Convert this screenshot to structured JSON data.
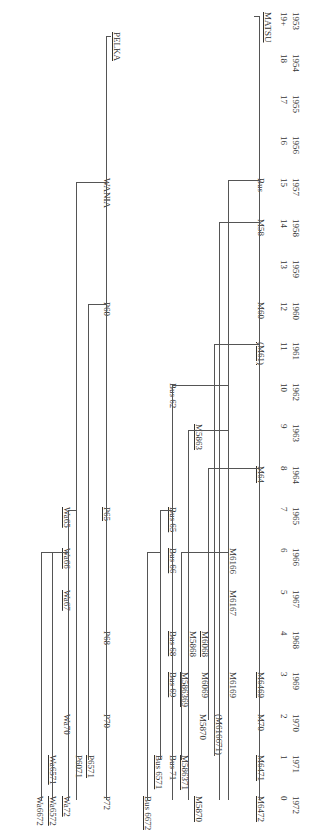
{
  "timeline": {
    "years": [
      "1953",
      "1954",
      "1955",
      "1956",
      "1957",
      "1958",
      "1959",
      "1960",
      "1961",
      "1962",
      "1963",
      "1964",
      "1965",
      "1966",
      "1967",
      "1968",
      "1969",
      "1970",
      "1971",
      "1972"
    ],
    "counts": [
      "19+",
      "18",
      "17",
      "16",
      "15",
      "14",
      "13",
      "12",
      "11",
      "10",
      "9",
      "8",
      "7",
      "6",
      "5",
      "4",
      "3",
      "2",
      "1",
      "0"
    ],
    "year_y": [
      12,
      54,
      95,
      136,
      178,
      219,
      260,
      302,
      342,
      383,
      424,
      466,
      507,
      548,
      590,
      631,
      672,
      714,
      755,
      796
    ]
  },
  "roots": [
    {
      "id": "MATSU",
      "label": "MATSU",
      "x": 262,
      "y": 12,
      "underline": true
    },
    {
      "id": "PELKA",
      "label": "PELKA",
      "x": 111,
      "y": 32,
      "underline": true
    }
  ],
  "nodes": [
    {
      "label": "Bus",
      "x": 256,
      "y": 178,
      "underline": false
    },
    {
      "label": "M58",
      "x": 256,
      "y": 219,
      "underline": false
    },
    {
      "label": "M60",
      "x": 256,
      "y": 302,
      "underline": false
    },
    {
      "label": "(M61)",
      "x": 256,
      "y": 342,
      "underline": true
    },
    {
      "label": "M64",
      "x": 256,
      "y": 466,
      "underline": true
    },
    {
      "label": "M6469",
      "x": 256,
      "y": 672,
      "underline": true
    },
    {
      "label": "M70",
      "x": 256,
      "y": 714,
      "underline": false
    },
    {
      "label": "M6471",
      "x": 256,
      "y": 755,
      "underline": true
    },
    {
      "label": "M6472",
      "x": 256,
      "y": 796,
      "underline": true
    },
    {
      "label": "M6166",
      "x": 228,
      "y": 548,
      "underline": true
    },
    {
      "label": "M6167",
      "x": 228,
      "y": 590,
      "underline": true
    },
    {
      "label": "M6169",
      "x": 228,
      "y": 672,
      "underline": false
    },
    {
      "label": "(M616671)",
      "x": 214,
      "y": 714,
      "underline": true
    },
    {
      "label": "M5863",
      "x": 194,
      "y": 424,
      "underline": true
    },
    {
      "label": "M6068",
      "x": 200,
      "y": 631,
      "underline": true
    },
    {
      "label": "M6069",
      "x": 200,
      "y": 672,
      "underline": false
    },
    {
      "label": "M5868",
      "x": 188,
      "y": 631,
      "underline": true
    },
    {
      "label": "M5870",
      "x": 198,
      "y": 714,
      "underline": false
    },
    {
      "label": "M586369",
      "x": 180,
      "y": 672,
      "underline": true
    },
    {
      "label": "M586371",
      "x": 180,
      "y": 755,
      "underline": true
    },
    {
      "label": "M5870",
      "x": 194,
      "y": 796,
      "underline": true
    },
    {
      "label": "Bus 62",
      "x": 168,
      "y": 383,
      "underline": false
    },
    {
      "label": "Bus 65",
      "x": 168,
      "y": 507,
      "underline": true
    },
    {
      "label": "Bus 66",
      "x": 168,
      "y": 548,
      "underline": true
    },
    {
      "label": "Bus 68",
      "x": 168,
      "y": 631,
      "underline": true
    },
    {
      "label": "Bus 69",
      "x": 168,
      "y": 672,
      "underline": true
    },
    {
      "label": "Bus 71",
      "x": 168,
      "y": 755,
      "underline": false
    },
    {
      "label": "Bus 6571",
      "x": 154,
      "y": 755,
      "underline": true
    },
    {
      "label": "Bus 6672",
      "x": 143,
      "y": 796,
      "underline": true
    },
    {
      "label": "WANIA",
      "x": 102,
      "y": 178,
      "underline": false
    },
    {
      "label": "P60",
      "x": 102,
      "y": 302,
      "underline": false
    },
    {
      "label": "P65",
      "x": 102,
      "y": 507,
      "underline": true
    },
    {
      "label": "P68",
      "x": 102,
      "y": 631,
      "underline": false
    },
    {
      "label": "P70",
      "x": 102,
      "y": 714,
      "underline": false
    },
    {
      "label": "P72",
      "x": 102,
      "y": 796,
      "underline": false
    },
    {
      "label": "P6571",
      "x": 86,
      "y": 755,
      "underline": true
    },
    {
      "label": "P6071",
      "x": 74,
      "y": 755,
      "underline": false
    },
    {
      "label": "Wa65",
      "x": 62,
      "y": 507,
      "underline": true
    },
    {
      "label": "Wa66",
      "x": 62,
      "y": 548,
      "underline": true
    },
    {
      "label": "Wa67",
      "x": 62,
      "y": 590,
      "underline": true
    },
    {
      "label": "Wa70",
      "x": 62,
      "y": 714,
      "underline": false
    },
    {
      "label": "Wa72",
      "x": 62,
      "y": 796,
      "underline": true
    },
    {
      "label": "Wa6571",
      "x": 48,
      "y": 755,
      "underline": true
    },
    {
      "label": "Wa6572",
      "x": 48,
      "y": 796,
      "underline": true
    },
    {
      "label": "Wa6672",
      "x": 35,
      "y": 796,
      "underline": false
    }
  ],
  "vlines": [
    [
      259,
      16,
      800
    ],
    [
      228,
      180,
      800
    ],
    [
      219,
      222,
      800
    ],
    [
      214,
      344,
      756
    ],
    [
      208,
      468,
      720
    ],
    [
      188,
      430,
      800
    ],
    [
      181,
      552,
      760
    ],
    [
      172,
      385,
      800
    ],
    [
      160,
      510,
      760
    ],
    [
      147,
      552,
      800
    ],
    [
      106,
      36,
      800
    ],
    [
      76,
      182,
      800
    ],
    [
      88,
      304,
      760
    ],
    [
      68,
      510,
      800
    ],
    [
      52,
      552,
      800
    ],
    [
      41,
      552,
      800
    ]
  ],
  "hlines": [
    [
      254,
      259,
      16
    ],
    [
      228,
      259,
      180
    ],
    [
      219,
      259,
      222
    ],
    [
      214,
      259,
      344
    ],
    [
      208,
      259,
      468
    ],
    [
      188,
      228,
      430
    ],
    [
      181,
      228,
      552
    ],
    [
      172,
      228,
      385
    ],
    [
      160,
      172,
      510
    ],
    [
      147,
      160,
      552
    ],
    [
      106,
      111,
      36
    ],
    [
      76,
      106,
      182
    ],
    [
      88,
      106,
      304
    ],
    [
      68,
      76,
      510
    ],
    [
      52,
      68,
      552
    ],
    [
      41,
      52,
      552
    ]
  ]
}
